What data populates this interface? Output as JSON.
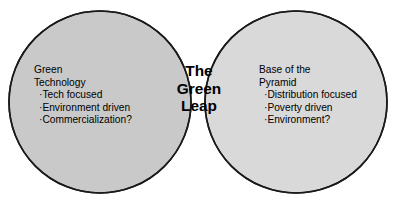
{
  "diagram": {
    "type": "venn-two-circle",
    "background_color": "#ffffff",
    "stroke_color": "#1a1a1a",
    "left_circle": {
      "fill_color": "#c9c9c9",
      "title_line_1": "Green",
      "title_line_2": "Technology",
      "bullet_char": "·",
      "bullets": [
        "Tech focused",
        "Environment driven",
        "Commercialization?"
      ]
    },
    "right_circle": {
      "fill_color": "#d9d9d9",
      "title_line_1": "Base of the",
      "title_line_2": "Pyramid",
      "bullet_char": "·",
      "bullets": [
        "Distribution focused",
        "Poverty driven",
        "Environment?"
      ]
    },
    "intersection": {
      "fill_color": "#bdbdbd",
      "line_1": "The",
      "line_2": "Green",
      "line_3": "Leap"
    }
  }
}
